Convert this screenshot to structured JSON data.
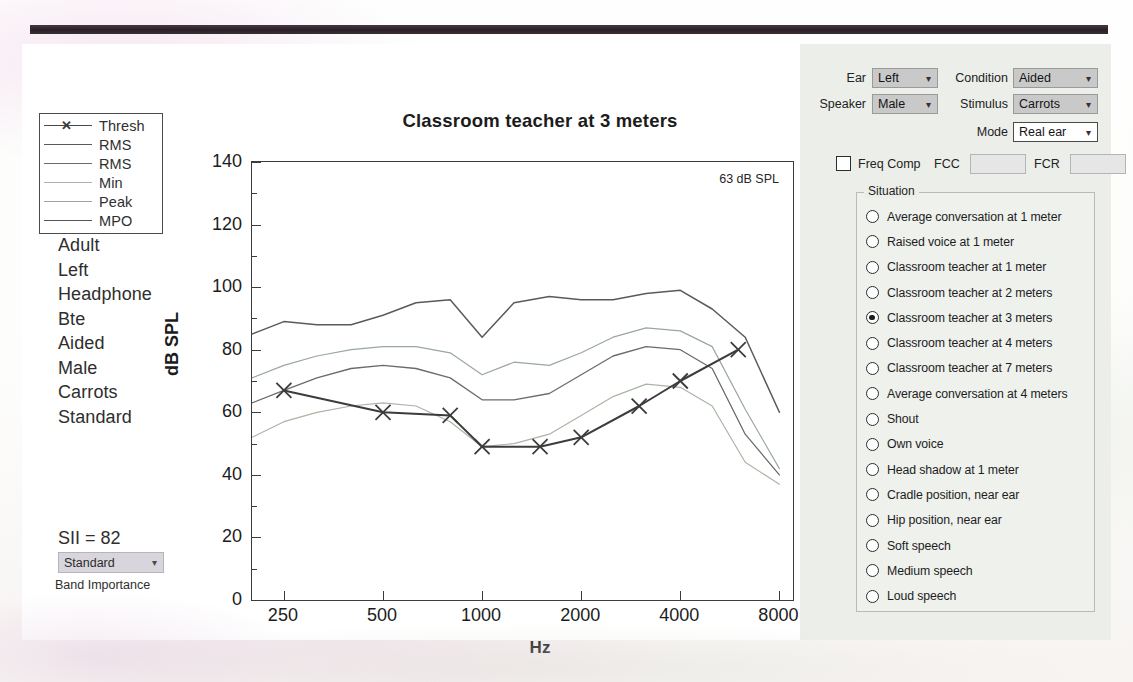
{
  "window": {
    "chart_panel_bg": "#ffffff",
    "control_panel_bg": "#eceeea"
  },
  "legend": {
    "items": [
      {
        "label": "Thresh",
        "color": "#4a4a4a",
        "marker": "x"
      },
      {
        "label": "RMS",
        "color": "#5a5a5a",
        "marker": "none"
      },
      {
        "label": "RMS",
        "color": "#6b6b6b",
        "marker": "none"
      },
      {
        "label": "Min",
        "color": "#a9b5a6",
        "marker": "none"
      },
      {
        "label": "Peak",
        "color": "#9aa89a",
        "marker": "none"
      },
      {
        "label": "MPO",
        "color": "#4f5a4f",
        "marker": "none"
      }
    ]
  },
  "config_list": [
    "Adult",
    "Left",
    "Headphone",
    "Bte",
    "Aided",
    "Male",
    "Carrots",
    "Standard"
  ],
  "sii": {
    "value_text": "SII = 82",
    "band_importance_value": "Standard",
    "band_importance_caption": "Band Importance"
  },
  "chart_data": {
    "type": "line",
    "title": "Classroom teacher at 3 meters",
    "xlabel": "Hz",
    "ylabel": "dB SPL",
    "annotation": "63 dB SPL",
    "grid": false,
    "legend_position": "outside-left",
    "xscale": "log",
    "xlim": [
      200,
      8800
    ],
    "ylim": [
      0,
      140
    ],
    "xticks": [
      250,
      500,
      1000,
      2000,
      4000,
      8000
    ],
    "yticks": [
      0,
      20,
      40,
      60,
      80,
      100,
      120,
      140
    ],
    "yminorticks": [
      10,
      30,
      50,
      70,
      90,
      110,
      130
    ],
    "x": [
      200,
      250,
      315,
      400,
      500,
      630,
      800,
      1000,
      1250,
      1600,
      2000,
      2500,
      3150,
      4000,
      5000,
      6300,
      8000
    ],
    "series": [
      {
        "name": "MPO",
        "color": "#5a5a5a",
        "width": 1.5,
        "marker": "none",
        "values": [
          85,
          89,
          88,
          88,
          91,
          95,
          96,
          84,
          95,
          97,
          96,
          96,
          98,
          99,
          93,
          84,
          60
        ]
      },
      {
        "name": "Peak",
        "color": "#9aa89a",
        "width": 1.2,
        "marker": "none",
        "values": [
          71,
          75,
          78,
          80,
          81,
          81,
          79,
          72,
          76,
          75,
          79,
          84,
          87,
          86,
          81,
          61,
          42
        ]
      },
      {
        "name": "RMS",
        "color": "#6b6b6b",
        "width": 1.3,
        "marker": "none",
        "values": [
          63,
          67,
          71,
          74,
          75,
          74,
          71,
          64,
          64,
          66,
          72,
          78,
          81,
          80,
          74,
          53,
          40
        ]
      },
      {
        "name": "Min",
        "color": "#a9b5a6",
        "width": 1.2,
        "marker": "none",
        "values": [
          52,
          57,
          60,
          62,
          63,
          62,
          57,
          49,
          50,
          53,
          59,
          65,
          69,
          68,
          62,
          44,
          37
        ]
      },
      {
        "name": "Thresh",
        "color": "#3c3c3c",
        "width": 2.0,
        "marker": "x",
        "points": [
          {
            "x": 250,
            "y": 67
          },
          {
            "x": 500,
            "y": 60
          },
          {
            "x": 800,
            "y": 59
          },
          {
            "x": 1000,
            "y": 49
          },
          {
            "x": 1500,
            "y": 49
          },
          {
            "x": 2000,
            "y": 52
          },
          {
            "x": 3000,
            "y": 62
          },
          {
            "x": 4000,
            "y": 70
          },
          {
            "x": 6000,
            "y": 80
          }
        ]
      }
    ]
  },
  "controls": {
    "ear": {
      "label": "Ear",
      "value": "Left"
    },
    "condition": {
      "label": "Condition",
      "value": "Aided"
    },
    "speaker": {
      "label": "Speaker",
      "value": "Male"
    },
    "stimulus": {
      "label": "Stimulus",
      "value": "Carrots"
    },
    "mode": {
      "label": "Mode",
      "value": "Real ear"
    },
    "freq_comp": {
      "label": "Freq Comp",
      "checked": false
    },
    "fcc": {
      "label": "FCC",
      "value": ""
    },
    "fcr": {
      "label": "FCR",
      "value": ""
    }
  },
  "situation": {
    "legend": "Situation",
    "selected_index": 4,
    "options": [
      "Average conversation at 1 meter",
      "Raised voice at 1 meter",
      "Classroom teacher at 1 meter",
      "Classroom teacher at 2 meters",
      "Classroom teacher at 3 meters",
      "Classroom teacher at 4 meters",
      "Classroom teacher at 7 meters",
      "Average conversation at 4 meters",
      "Shout",
      "Own voice",
      "Head shadow at 1 meter",
      "Cradle position, near ear",
      "Hip position, near ear",
      "Soft speech",
      "Medium speech",
      "Loud speech"
    ]
  }
}
